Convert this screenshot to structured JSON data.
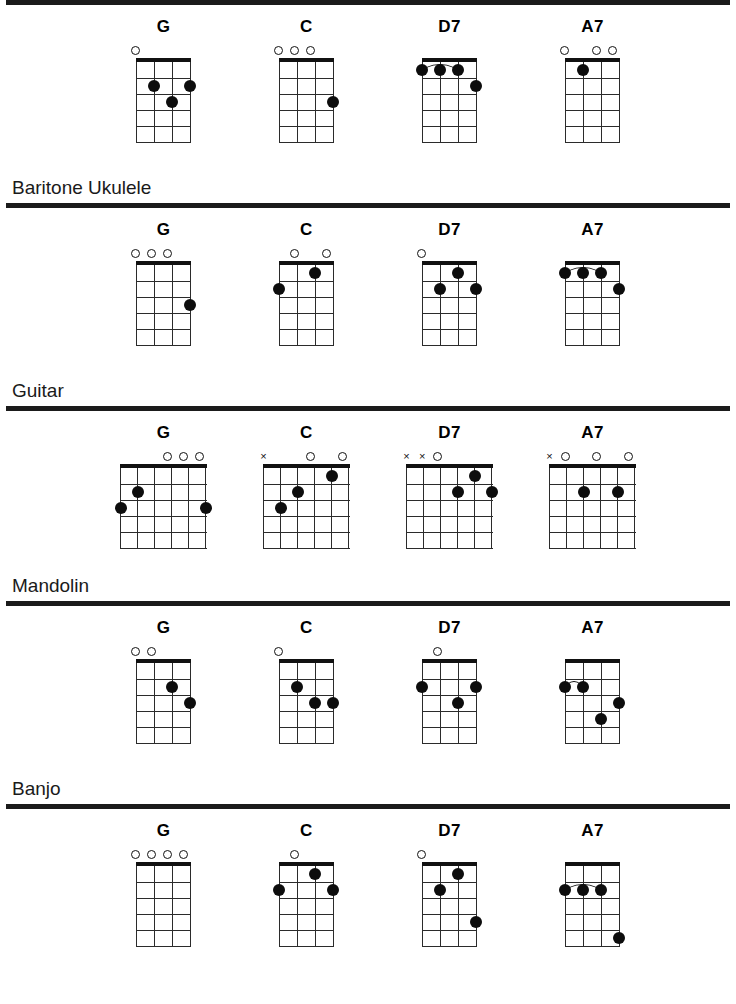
{
  "document": {
    "title": "Chord Chart — G C D7 A7 for Ukulele, Baritone Ukulele, Guitar, Mandolin, Banjo"
  },
  "chart_data": {
    "type": "table",
    "chord_names": [
      "G",
      "C",
      "D7",
      "A7"
    ],
    "notation": {
      "O": "open string",
      "X": "muted / not played string",
      "dot": "finger at string/fret",
      "arc": "barre"
    },
    "sections": [
      {
        "label": "",
        "label_visible": false,
        "strings": 4,
        "frets": 5,
        "chords": [
          {
            "name": "G",
            "markers": [
              "O",
              "",
              "",
              ""
            ],
            "dots": [
              {
                "string": 2,
                "fret": 2
              },
              {
                "string": 4,
                "fret": 2
              },
              {
                "string": 3,
                "fret": 3
              }
            ],
            "barres": []
          },
          {
            "name": "C",
            "markers": [
              "O",
              "O",
              "O",
              ""
            ],
            "dots": [
              {
                "string": 4,
                "fret": 3
              }
            ],
            "barres": []
          },
          {
            "name": "D7",
            "markers": [
              "",
              "",
              "",
              ""
            ],
            "dots": [
              {
                "string": 1,
                "fret": 1
              },
              {
                "string": 2,
                "fret": 1
              },
              {
                "string": 3,
                "fret": 1
              },
              {
                "string": 4,
                "fret": 2
              }
            ],
            "barres": [
              {
                "fret": 1,
                "from": 1,
                "to": 3
              }
            ]
          },
          {
            "name": "A7",
            "markers": [
              "O",
              "",
              "O",
              "O"
            ],
            "dots": [
              {
                "string": 2,
                "fret": 1
              }
            ],
            "barres": []
          }
        ]
      },
      {
        "label": "Baritone Ukulele",
        "label_visible": true,
        "strings": 4,
        "frets": 5,
        "chords": [
          {
            "name": "G",
            "markers": [
              "O",
              "O",
              "O",
              ""
            ],
            "dots": [
              {
                "string": 4,
                "fret": 3
              }
            ],
            "barres": []
          },
          {
            "name": "C",
            "markers": [
              "",
              "O",
              "",
              "O"
            ],
            "dots": [
              {
                "string": 3,
                "fret": 1
              },
              {
                "string": 1,
                "fret": 2
              }
            ],
            "barres": []
          },
          {
            "name": "D7",
            "markers": [
              "O",
              "",
              "",
              ""
            ],
            "dots": [
              {
                "string": 3,
                "fret": 1
              },
              {
                "string": 2,
                "fret": 2
              },
              {
                "string": 4,
                "fret": 2
              }
            ],
            "barres": []
          },
          {
            "name": "A7",
            "markers": [
              "",
              "",
              "",
              ""
            ],
            "dots": [
              {
                "string": 1,
                "fret": 1
              },
              {
                "string": 2,
                "fret": 1
              },
              {
                "string": 3,
                "fret": 1
              },
              {
                "string": 4,
                "fret": 2
              }
            ],
            "barres": [
              {
                "fret": 1,
                "from": 1,
                "to": 3
              }
            ]
          }
        ]
      },
      {
        "label": "Guitar",
        "label_visible": true,
        "strings": 6,
        "frets": 5,
        "chords": [
          {
            "name": "G",
            "markers": [
              "",
              "",
              "",
              "O",
              "O",
              "O"
            ],
            "dots": [
              {
                "string": 2,
                "fret": 2
              },
              {
                "string": 1,
                "fret": 3
              },
              {
                "string": 6,
                "fret": 3
              }
            ],
            "barres": []
          },
          {
            "name": "C",
            "markers": [
              "X",
              "",
              "",
              "O",
              "",
              "O"
            ],
            "dots": [
              {
                "string": 5,
                "fret": 1
              },
              {
                "string": 3,
                "fret": 2
              },
              {
                "string": 2,
                "fret": 3
              }
            ],
            "barres": []
          },
          {
            "name": "D7",
            "markers": [
              "X",
              "X",
              "O",
              "",
              "",
              ""
            ],
            "dots": [
              {
                "string": 5,
                "fret": 1
              },
              {
                "string": 4,
                "fret": 2
              },
              {
                "string": 6,
                "fret": 2
              }
            ],
            "barres": []
          },
          {
            "name": "A7",
            "markers": [
              "X",
              "O",
              "",
              "O",
              "",
              "O"
            ],
            "dots": [
              {
                "string": 3,
                "fret": 2
              },
              {
                "string": 5,
                "fret": 2
              }
            ],
            "barres": []
          }
        ]
      },
      {
        "label": "Mandolin",
        "label_visible": true,
        "strings": 4,
        "frets": 5,
        "chords": [
          {
            "name": "G",
            "markers": [
              "O",
              "O",
              "",
              ""
            ],
            "dots": [
              {
                "string": 3,
                "fret": 2
              },
              {
                "string": 4,
                "fret": 3
              }
            ],
            "barres": []
          },
          {
            "name": "C",
            "markers": [
              "O",
              "",
              "",
              ""
            ],
            "dots": [
              {
                "string": 2,
                "fret": 2
              },
              {
                "string": 3,
                "fret": 3
              },
              {
                "string": 4,
                "fret": 3
              }
            ],
            "barres": []
          },
          {
            "name": "D7",
            "markers": [
              "",
              "O",
              "",
              ""
            ],
            "dots": [
              {
                "string": 1,
                "fret": 2
              },
              {
                "string": 4,
                "fret": 2
              },
              {
                "string": 3,
                "fret": 3
              }
            ],
            "barres": []
          },
          {
            "name": "A7",
            "markers": [
              "",
              "",
              "",
              ""
            ],
            "dots": [
              {
                "string": 1,
                "fret": 2
              },
              {
                "string": 2,
                "fret": 2
              },
              {
                "string": 4,
                "fret": 3
              },
              {
                "string": 3,
                "fret": 4
              }
            ],
            "barres": [
              {
                "fret": 2,
                "from": 1,
                "to": 2
              }
            ]
          }
        ]
      },
      {
        "label": "Banjo",
        "label_visible": true,
        "strings": 4,
        "frets": 5,
        "chords": [
          {
            "name": "G",
            "markers": [
              "O",
              "O",
              "O",
              "O"
            ],
            "dots": [],
            "barres": []
          },
          {
            "name": "C",
            "markers": [
              "",
              "O",
              "",
              ""
            ],
            "dots": [
              {
                "string": 3,
                "fret": 1
              },
              {
                "string": 1,
                "fret": 2
              },
              {
                "string": 4,
                "fret": 2
              }
            ],
            "barres": []
          },
          {
            "name": "D7",
            "markers": [
              "O",
              "",
              "",
              ""
            ],
            "dots": [
              {
                "string": 3,
                "fret": 1
              },
              {
                "string": 2,
                "fret": 2
              },
              {
                "string": 4,
                "fret": 4
              }
            ],
            "barres": []
          },
          {
            "name": "A7",
            "markers": [
              "",
              "",
              "",
              ""
            ],
            "dots": [
              {
                "string": 1,
                "fret": 2
              },
              {
                "string": 2,
                "fret": 2
              },
              {
                "string": 3,
                "fret": 2
              },
              {
                "string": 4,
                "fret": 5
              }
            ],
            "barres": [
              {
                "fret": 2,
                "from": 1,
                "to": 3
              }
            ]
          }
        ]
      }
    ]
  },
  "colors": {
    "ink": "#111111",
    "rule": "#1b1b1b",
    "dot": "#0d0d0d",
    "paper": "#ffffff"
  }
}
